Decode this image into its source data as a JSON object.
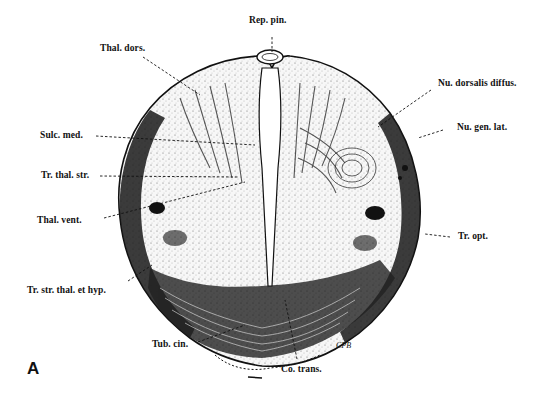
{
  "figure": {
    "panel_letter": "A",
    "signature": "CPB",
    "labels": {
      "rep_pin": "Rep. pin.",
      "thal_dors": "Thal. dors.",
      "nu_dorsalis_diffus": "Nu. dorsalis diffus.",
      "sulc_med": "Sulc. med.",
      "nu_gen_lat": "Nu. gen. lat.",
      "tr_thal_str": "Tr. thal. str.",
      "thal_vent": "Thal. vent.",
      "tr_opt": "Tr. opt.",
      "tr_str_thal_et_hyp": "Tr. str. thal. et hyp.",
      "tub_cin": "Tub. cin.",
      "co_trans": "Co. trans."
    },
    "colors": {
      "ink": "#111111",
      "background": "#ffffff",
      "tissue": "#f4f4f4"
    }
  }
}
